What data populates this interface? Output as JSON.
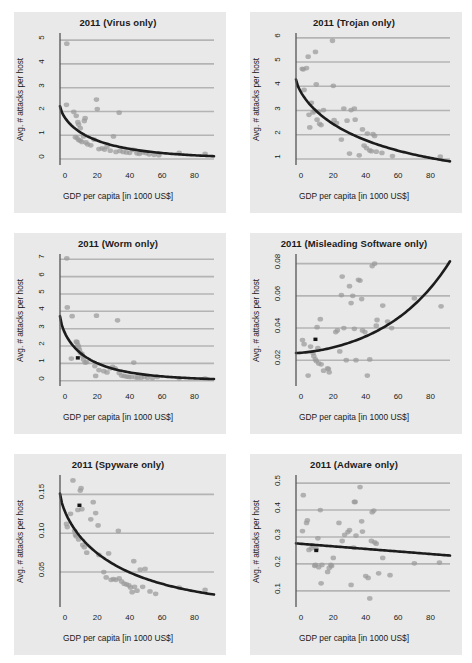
{
  "figure": {
    "name": "malware-attacks-vs-gdp-panels",
    "background": "#ffffff",
    "panel_background": "#e9e9e9",
    "point_color": "#9a9a9a",
    "trend_color": "#1c1c1c",
    "highlight_color": "#141414",
    "grid_color": "#b4b4b4",
    "rows": 3,
    "cols": 2
  },
  "chart_data": [
    {
      "type": "scatter",
      "title": "2011 (Virus only)",
      "xlabel": "GDP per capita [in 1000 US$]",
      "ylabel": "Avg. # attacks per host",
      "xlim": [
        -3,
        92
      ],
      "ylim": [
        -0.25,
        5.3
      ],
      "xticks": [
        0,
        20,
        40,
        60,
        80
      ],
      "yticks": [
        0,
        1,
        2,
        3,
        4,
        5
      ],
      "grid": true,
      "legend": "none",
      "points": [
        [
          1.2,
          4.85
        ],
        [
          1.0,
          2.28
        ],
        [
          5.5,
          1.98
        ],
        [
          7.0,
          1.82
        ],
        [
          8.0,
          1.55
        ],
        [
          8.5,
          1.45
        ],
        [
          9.5,
          1.3
        ],
        [
          6.5,
          0.92
        ],
        [
          7.5,
          0.88
        ],
        [
          8.5,
          0.8
        ],
        [
          9.5,
          0.78
        ],
        [
          10.5,
          0.72
        ],
        [
          11.5,
          0.95
        ],
        [
          12.0,
          1.6
        ],
        [
          12.5,
          1.72
        ],
        [
          13.0,
          0.7
        ],
        [
          14.0,
          0.62
        ],
        [
          16.0,
          0.58
        ],
        [
          18.0,
          0.82
        ],
        [
          19.5,
          2.5
        ],
        [
          20.0,
          2.1
        ],
        [
          21.0,
          0.42
        ],
        [
          23.0,
          0.45
        ],
        [
          24.5,
          0.4
        ],
        [
          26.0,
          0.52
        ],
        [
          28.0,
          0.35
        ],
        [
          30.0,
          0.95
        ],
        [
          31.5,
          0.3
        ],
        [
          33.5,
          1.95
        ],
        [
          34.0,
          0.34
        ],
        [
          36.0,
          0.3
        ],
        [
          38.0,
          0.28
        ],
        [
          40.0,
          0.26
        ],
        [
          41.5,
          0.4
        ],
        [
          43.0,
          0.38
        ],
        [
          44.5,
          0.24
        ],
        [
          46.0,
          0.22
        ],
        [
          48.0,
          0.28
        ],
        [
          50.0,
          0.25
        ],
        [
          52.0,
          0.2
        ],
        [
          55.0,
          0.18
        ],
        [
          58.0,
          0.16
        ],
        [
          70.5,
          0.26
        ],
        [
          86.5,
          0.22
        ]
      ],
      "highlight_point": null,
      "trend": {
        "kind": "decay",
        "y_at_xmin": 2.22,
        "y_at_xmax": 0.12
      }
    },
    {
      "type": "scatter",
      "title": "2011 (Trojan only)",
      "xlabel": "GDP per capita [in 1000 US$]",
      "ylabel": "Avg. # attacks per host",
      "xlim": [
        -3,
        92
      ],
      "ylim": [
        0.75,
        6.2
      ],
      "xticks": [
        0,
        20,
        40,
        60,
        80
      ],
      "yticks": [
        1,
        2,
        3,
        4,
        5,
        6
      ],
      "grid": true,
      "legend": "none",
      "points": [
        [
          0.8,
          4.72
        ],
        [
          1.5,
          4.7
        ],
        [
          2.0,
          3.85
        ],
        [
          3.5,
          4.75
        ],
        [
          4.5,
          5.22
        ],
        [
          5.0,
          2.82
        ],
        [
          5.5,
          2.3
        ],
        [
          6.5,
          3.32
        ],
        [
          7.5,
          2.92
        ],
        [
          8.5,
          2.98
        ],
        [
          9.0,
          5.42
        ],
        [
          9.5,
          4.08
        ],
        [
          10.0,
          2.62
        ],
        [
          11.0,
          2.95
        ],
        [
          11.5,
          2.45
        ],
        [
          12.5,
          2.4
        ],
        [
          14.0,
          3.02
        ],
        [
          19.5,
          5.88
        ],
        [
          20.0,
          4.02
        ],
        [
          20.5,
          2.6
        ],
        [
          22.0,
          2.48
        ],
        [
          25.0,
          1.8
        ],
        [
          26.5,
          3.08
        ],
        [
          28.5,
          2.58
        ],
        [
          30.0,
          1.22
        ],
        [
          31.0,
          3.02
        ],
        [
          33.0,
          3.08
        ],
        [
          33.5,
          2.62
        ],
        [
          36.0,
          1.15
        ],
        [
          38.0,
          2.22
        ],
        [
          39.0,
          1.55
        ],
        [
          40.5,
          1.45
        ],
        [
          41.0,
          2.05
        ],
        [
          42.5,
          1.35
        ],
        [
          43.5,
          1.32
        ],
        [
          44.5,
          2.02
        ],
        [
          45.5,
          1.95
        ],
        [
          46.5,
          1.3
        ],
        [
          50.0,
          1.25
        ],
        [
          56.5,
          1.12
        ],
        [
          86.0,
          1.1
        ]
      ],
      "highlight_point": null,
      "trend": {
        "kind": "decay",
        "y_at_xmin": 4.28,
        "y_at_xmax": 0.9
      }
    },
    {
      "type": "scatter",
      "title": "2011 (Worm only)",
      "xlabel": "GDP per capita [in 1000 US$]",
      "ylabel": "Avg. # attacks per host",
      "xlim": [
        -3,
        92
      ],
      "ylim": [
        -0.3,
        7.3
      ],
      "xticks": [
        0,
        20,
        40,
        60,
        80
      ],
      "yticks": [
        0,
        1,
        2,
        3,
        4,
        5,
        6,
        7
      ],
      "grid": true,
      "legend": "none",
      "points": [
        [
          1.2,
          7.05
        ],
        [
          1.5,
          4.22
        ],
        [
          4.5,
          3.72
        ],
        [
          4.0,
          1.28
        ],
        [
          7.0,
          2.25
        ],
        [
          7.5,
          2.22
        ],
        [
          8.0,
          2.05
        ],
        [
          8.5,
          1.95
        ],
        [
          9.0,
          1.78
        ],
        [
          9.5,
          1.62
        ],
        [
          10.5,
          1.55
        ],
        [
          11.0,
          1.42
        ],
        [
          11.5,
          1.22
        ],
        [
          12.5,
          1.05
        ],
        [
          13.5,
          1.08
        ],
        [
          18.5,
          0.85
        ],
        [
          19.0,
          0.28
        ],
        [
          19.5,
          3.75
        ],
        [
          21.0,
          0.62
        ],
        [
          24.0,
          0.55
        ],
        [
          26.0,
          0.48
        ],
        [
          28.0,
          0.72
        ],
        [
          29.5,
          0.8
        ],
        [
          31.0,
          0.72
        ],
        [
          32.5,
          3.48
        ],
        [
          33.5,
          0.45
        ],
        [
          35.0,
          0.3
        ],
        [
          36.5,
          0.28
        ],
        [
          38.0,
          0.24
        ],
        [
          39.5,
          0.22
        ],
        [
          41.0,
          0.22
        ],
        [
          42.5,
          1.05
        ],
        [
          43.5,
          0.2
        ],
        [
          45.0,
          0.18
        ],
        [
          47.0,
          0.18
        ],
        [
          49.0,
          0.22
        ],
        [
          51.0,
          0.18
        ],
        [
          54.0,
          0.16
        ],
        [
          57.0,
          0.22
        ],
        [
          70.5,
          0.14
        ],
        [
          86.5,
          0.12
        ]
      ],
      "highlight_point": [
        8.0,
        1.32
      ],
      "trend": {
        "kind": "decay",
        "y_at_xmin": 3.72,
        "y_at_xmax": 0.1
      }
    },
    {
      "type": "scatter",
      "title": "2011 (Misleading Software only)",
      "xlabel": "GDP per capita [in 1000 US$]",
      "ylabel": "Avg. # attacks per host",
      "xlim": [
        -3,
        92
      ],
      "ylim": [
        0.004,
        0.086
      ],
      "xticks": [
        0,
        20,
        40,
        60,
        80
      ],
      "yticks": [
        0.02,
        0.04,
        0.06,
        0.08
      ],
      "ytick_labels": [
        "0.02",
        "0.04",
        "0.06",
        "0.08"
      ],
      "grid": true,
      "legend": "none",
      "points": [
        [
          1.0,
          0.0325
        ],
        [
          2.0,
          0.03
        ],
        [
          4.5,
          0.0105
        ],
        [
          6.0,
          0.0285
        ],
        [
          7.5,
          0.0245
        ],
        [
          8.0,
          0.0225
        ],
        [
          9.0,
          0.0205
        ],
        [
          9.5,
          0.0195
        ],
        [
          10.0,
          0.0405
        ],
        [
          10.5,
          0.0275
        ],
        [
          11.0,
          0.018
        ],
        [
          12.0,
          0.0455
        ],
        [
          12.5,
          0.0175
        ],
        [
          14.0,
          0.0135
        ],
        [
          16.5,
          0.015
        ],
        [
          17.0,
          0.0145
        ],
        [
          17.5,
          0.0125
        ],
        [
          21.5,
          0.0375
        ],
        [
          22.5,
          0.0385
        ],
        [
          24.0,
          0.0255
        ],
        [
          25.0,
          0.0605
        ],
        [
          25.5,
          0.072
        ],
        [
          26.5,
          0.04
        ],
        [
          28.0,
          0.02
        ],
        [
          30.0,
          0.066
        ],
        [
          31.0,
          0.0555
        ],
        [
          32.0,
          0.06
        ],
        [
          33.0,
          0.0395
        ],
        [
          34.0,
          0.02
        ],
        [
          35.5,
          0.07
        ],
        [
          36.5,
          0.0695
        ],
        [
          37.5,
          0.058
        ],
        [
          38.0,
          0.0385
        ],
        [
          39.5,
          0.0375
        ],
        [
          41.0,
          0.0105
        ],
        [
          42.5,
          0.0205
        ],
        [
          44.0,
          0.0785
        ],
        [
          45.5,
          0.08
        ],
        [
          46.5,
          0.0415
        ],
        [
          47.0,
          0.045
        ],
        [
          50.5,
          0.054
        ],
        [
          53.5,
          0.044
        ],
        [
          56.0,
          0.04
        ],
        [
          70.0,
          0.0585
        ],
        [
          86.5,
          0.0535
        ]
      ],
      "highlight_point": [
        9.0,
        0.033
      ],
      "trend": {
        "kind": "growth",
        "y_at_xmin": 0.0245,
        "y_at_xmax": 0.0815
      }
    },
    {
      "type": "scatter",
      "title": "2011 (Spyware only)",
      "xlabel": "GDP per capita [in 1000 US$]",
      "ylabel": "Avg. # attacks per host",
      "xlim": [
        -3,
        92
      ],
      "ylim": [
        0.005,
        0.175
      ],
      "xticks": [
        0,
        20,
        40,
        60,
        80
      ],
      "yticks": [
        0.05,
        0.1,
        0.15
      ],
      "ytick_labels": [
        "0.05",
        "0.10",
        "0.15"
      ],
      "grid": true,
      "legend": "none",
      "points": [
        [
          1.0,
          0.112
        ],
        [
          1.5,
          0.108
        ],
        [
          3.5,
          0.125
        ],
        [
          5.0,
          0.168
        ],
        [
          6.0,
          0.103
        ],
        [
          6.5,
          0.098
        ],
        [
          7.0,
          0.096
        ],
        [
          8.0,
          0.13
        ],
        [
          8.5,
          0.092
        ],
        [
          9.5,
          0.155
        ],
        [
          10.0,
          0.158
        ],
        [
          10.5,
          0.131
        ],
        [
          11.0,
          0.085
        ],
        [
          12.0,
          0.082
        ],
        [
          13.5,
          0.075
        ],
        [
          16.0,
          0.118
        ],
        [
          17.5,
          0.14
        ],
        [
          19.0,
          0.126
        ],
        [
          20.5,
          0.11
        ],
        [
          21.0,
          0.072
        ],
        [
          24.0,
          0.05
        ],
        [
          25.5,
          0.043
        ],
        [
          27.0,
          0.074
        ],
        [
          28.5,
          0.04
        ],
        [
          30.0,
          0.041
        ],
        [
          31.5,
          0.04
        ],
        [
          33.0,
          0.103
        ],
        [
          33.5,
          0.042
        ],
        [
          35.0,
          0.038
        ],
        [
          36.5,
          0.035
        ],
        [
          38.0,
          0.034
        ],
        [
          39.5,
          0.033
        ],
        [
          40.5,
          0.03
        ],
        [
          41.5,
          0.024
        ],
        [
          42.5,
          0.064
        ],
        [
          43.0,
          0.031
        ],
        [
          44.5,
          0.026
        ],
        [
          46.5,
          0.053
        ],
        [
          48.0,
          0.031
        ],
        [
          49.5,
          0.054
        ],
        [
          52.5,
          0.025
        ],
        [
          56.0,
          0.022
        ],
        [
          70.5,
          0.03
        ],
        [
          86.5,
          0.027
        ]
      ],
      "highlight_point": [
        9.0,
        0.136
      ],
      "trend": {
        "kind": "decay",
        "y_at_xmin": 0.151,
        "y_at_xmax": 0.021
      }
    },
    {
      "type": "scatter",
      "title": "2011 (Adware only)",
      "xlabel": "GDP per capita [in 1000 US$]",
      "ylabel": "Avg. # attacks per host",
      "xlim": [
        -3,
        92
      ],
      "ylim": [
        0.04,
        0.53
      ],
      "xticks": [
        0,
        20,
        40,
        60,
        80
      ],
      "yticks": [
        0.1,
        0.2,
        0.3,
        0.4,
        0.5
      ],
      "ytick_labels": [
        "0.1",
        "0.2",
        "0.3",
        "0.4",
        "0.5"
      ],
      "grid": true,
      "legend": "none",
      "points": [
        [
          1.0,
          0.322
        ],
        [
          1.5,
          0.455
        ],
        [
          3.5,
          0.352
        ],
        [
          4.0,
          0.362
        ],
        [
          5.0,
          0.252
        ],
        [
          6.5,
          0.258
        ],
        [
          7.5,
          0.268
        ],
        [
          8.5,
          0.193
        ],
        [
          9.0,
          0.196
        ],
        [
          9.5,
          0.255
        ],
        [
          10.5,
          0.295
        ],
        [
          11.0,
          0.188
        ],
        [
          12.0,
          0.4
        ],
        [
          12.5,
          0.128
        ],
        [
          13.0,
          0.196
        ],
        [
          16.5,
          0.17
        ],
        [
          17.5,
          0.185
        ],
        [
          18.5,
          0.196
        ],
        [
          19.0,
          0.192
        ],
        [
          20.0,
          0.222
        ],
        [
          23.5,
          0.352
        ],
        [
          25.5,
          0.285
        ],
        [
          27.0,
          0.308
        ],
        [
          29.0,
          0.318
        ],
        [
          30.0,
          0.325
        ],
        [
          31.0,
          0.122
        ],
        [
          32.5,
          0.26
        ],
        [
          33.0,
          0.43
        ],
        [
          33.5,
          0.43
        ],
        [
          34.0,
          0.305
        ],
        [
          36.5,
          0.485
        ],
        [
          37.5,
          0.358
        ],
        [
          38.0,
          0.32
        ],
        [
          40.0,
          0.155
        ],
        [
          41.5,
          0.148
        ],
        [
          42.5,
          0.072
        ],
        [
          43.5,
          0.285
        ],
        [
          44.0,
          0.392
        ],
        [
          45.0,
          0.398
        ],
        [
          45.5,
          0.28
        ],
        [
          46.5,
          0.275
        ],
        [
          48.0,
          0.165
        ],
        [
          50.5,
          0.222
        ],
        [
          55.0,
          0.158
        ],
        [
          70.0,
          0.202
        ],
        [
          85.5,
          0.205
        ]
      ],
      "highlight_point": [
        9.5,
        0.25
      ],
      "trend": {
        "kind": "linear",
        "y_at_xmin": 0.276,
        "y_at_xmax": 0.231
      }
    }
  ]
}
